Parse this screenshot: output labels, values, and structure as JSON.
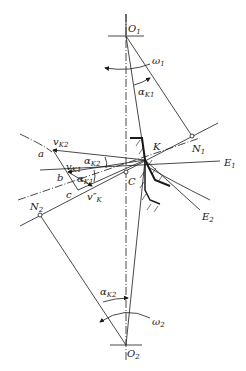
{
  "diagram": {
    "colors": {
      "line": "#1a1a1a",
      "background": "#ffffff"
    },
    "labels": {
      "O1": {
        "main": "O",
        "sub": "1"
      },
      "O2": {
        "main": "O",
        "sub": "2"
      },
      "omega1": {
        "main": "ω",
        "sub": "1"
      },
      "omega2": {
        "main": "ω",
        "sub": "2"
      },
      "alphaK1_top": {
        "main": "α",
        "sub": "K1"
      },
      "alphaK2_bottom": {
        "main": "α",
        "sub": "K2"
      },
      "alphaK2_mid": {
        "main": "α",
        "sub": "K2"
      },
      "alphaK1_mid": {
        "main": "α",
        "sub": "K1"
      },
      "vK2": {
        "main": "v",
        "sub": "K2"
      },
      "vK1": {
        "main": "v",
        "sub": "K1"
      },
      "vppK": {
        "main": "v″",
        "sub": "K"
      },
      "K": "K",
      "C": "C",
      "N1": {
        "main": "N",
        "sub": "1"
      },
      "N2": {
        "main": "N",
        "sub": "2"
      },
      "E1": {
        "main": "E",
        "sub": "1"
      },
      "E2": {
        "main": "E",
        "sub": "2"
      },
      "a": "a",
      "b": "b",
      "c": "c"
    }
  }
}
